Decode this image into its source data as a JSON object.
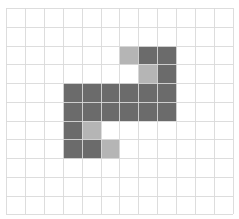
{
  "grid": {
    "cols": 12,
    "rows": 11,
    "origin_x": 6,
    "origin_y": 8,
    "cell_w": 18.9,
    "cell_h": 18.75,
    "line_color": "#d9d9d9",
    "background": "#ffffff"
  },
  "colors": {
    "dark": "#6b6b6b",
    "light": "#b5b5b5"
  },
  "cells": [
    {
      "row": 2,
      "col": 6,
      "shade": "light"
    },
    {
      "row": 2,
      "col": 7,
      "shade": "dark"
    },
    {
      "row": 2,
      "col": 8,
      "shade": "dark"
    },
    {
      "row": 3,
      "col": 7,
      "shade": "light"
    },
    {
      "row": 3,
      "col": 8,
      "shade": "dark"
    },
    {
      "row": 4,
      "col": 3,
      "shade": "dark"
    },
    {
      "row": 4,
      "col": 4,
      "shade": "dark"
    },
    {
      "row": 4,
      "col": 5,
      "shade": "dark"
    },
    {
      "row": 4,
      "col": 6,
      "shade": "dark"
    },
    {
      "row": 4,
      "col": 7,
      "shade": "dark"
    },
    {
      "row": 4,
      "col": 8,
      "shade": "dark"
    },
    {
      "row": 5,
      "col": 3,
      "shade": "dark"
    },
    {
      "row": 5,
      "col": 4,
      "shade": "dark"
    },
    {
      "row": 5,
      "col": 5,
      "shade": "dark"
    },
    {
      "row": 5,
      "col": 6,
      "shade": "dark"
    },
    {
      "row": 5,
      "col": 7,
      "shade": "dark"
    },
    {
      "row": 5,
      "col": 8,
      "shade": "dark"
    },
    {
      "row": 6,
      "col": 3,
      "shade": "dark"
    },
    {
      "row": 6,
      "col": 4,
      "shade": "light"
    },
    {
      "row": 7,
      "col": 3,
      "shade": "dark"
    },
    {
      "row": 7,
      "col": 4,
      "shade": "dark"
    },
    {
      "row": 7,
      "col": 5,
      "shade": "light"
    }
  ]
}
